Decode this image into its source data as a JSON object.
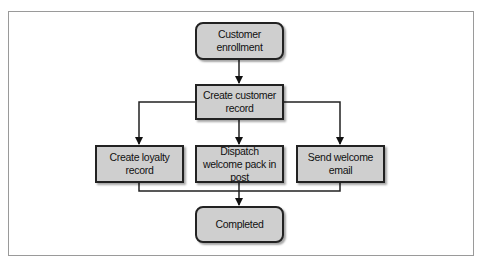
{
  "diagram": {
    "type": "flowchart",
    "nodes": [
      {
        "id": "enroll",
        "label": "Customer enrollment",
        "shape": "rounded"
      },
      {
        "id": "create",
        "label": "Create customer record",
        "shape": "rect"
      },
      {
        "id": "loyalty",
        "label": "Create loyalty record",
        "shape": "rect"
      },
      {
        "id": "dispatch",
        "label": "Dispatch welcome pack in post",
        "shape": "rect"
      },
      {
        "id": "email",
        "label": "Send welcome email",
        "shape": "rect"
      },
      {
        "id": "completed",
        "label": "Completed",
        "shape": "rounded"
      }
    ],
    "edges": [
      {
        "from": "enroll",
        "to": "create"
      },
      {
        "from": "create",
        "to": "loyalty"
      },
      {
        "from": "create",
        "to": "dispatch"
      },
      {
        "from": "create",
        "to": "email"
      },
      {
        "from": "loyalty",
        "to": "completed"
      },
      {
        "from": "dispatch",
        "to": "completed"
      },
      {
        "from": "email",
        "to": "completed"
      }
    ],
    "colors": {
      "node_fill": "#cfcfcf",
      "stroke": "#222222",
      "frame": "#9a9a9a"
    }
  }
}
